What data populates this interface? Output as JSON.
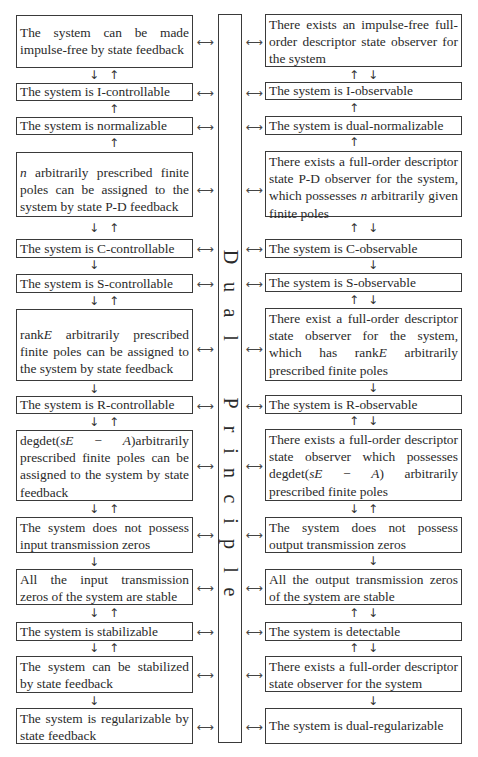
{
  "center": {
    "label": "Dual Principle",
    "letters": [
      "D",
      "u",
      "a",
      "l",
      "P",
      "r",
      "i",
      "n",
      "c",
      "i",
      "p",
      "l",
      "e"
    ]
  },
  "left": [
    {
      "text": "The system can be made impulse-free by state feedback"
    },
    {
      "text": "The system is I-controllable"
    },
    {
      "text": "The system is normalizable"
    },
    {
      "text": "n arbitrarily prescribed finite poles can be assigned to the system by state P-D feedback"
    },
    {
      "text": "The system is C-controllable"
    },
    {
      "text": "The system is S-controllable"
    },
    {
      "text": "rankE arbitrarily prescribed finite poles can be assigned to the system by state feedback"
    },
    {
      "text": "The system is R-controllable"
    },
    {
      "text": "degdet(sE − A)arbitrarily prescribed finite poles can be assigned to the system by state feedback"
    },
    {
      "text": "The system does not possess input transmission zeros"
    },
    {
      "text": "All the input transmission zeros of the system are stable"
    },
    {
      "text": "The system is stabilizable"
    },
    {
      "text": "The system can be stabilized by state feedback"
    },
    {
      "text": "The system is regularizable by state feedback"
    }
  ],
  "right": [
    {
      "text": "There exists an impulse-free full-order descriptor state observer for the system"
    },
    {
      "text": "The system is I-observable"
    },
    {
      "text": "The system is dual-normalizable"
    },
    {
      "text": "There exists a full-order descriptor state P-D observer for the system, which possesses n arbitrarily given finite poles"
    },
    {
      "text": "The system is C-observable"
    },
    {
      "text": "The system is S-observable"
    },
    {
      "text": "There exist a full-order descriptor state observer for the system, which has rankE arbitrarily prescribed finite poles"
    },
    {
      "text": "The system is R-observable"
    },
    {
      "text": "There exists a full-order descriptor state observer which possesses degdet(sE − A) arbitrarily prescribed finite poles"
    },
    {
      "text": "The system does not possess output transmission zeros"
    },
    {
      "text": "All the output transmission zeros of the system are stable"
    },
    {
      "text": "The system is detectable"
    },
    {
      "text": "There exists a full-order descriptor state observer for the system"
    },
    {
      "text": "The system is dual-regularizable"
    }
  ],
  "segments": {
    "l1": "The system can be made impulse-free by state feedback",
    "l2": "The system is I-controllable",
    "l3": "The system is normalizable",
    "l4_var": "n",
    "l4_rest": " arbitrarily prescribed finite poles can be assigned to the system by state P-D feedback",
    "l5": "The system is C-controllable",
    "l6": "The system is S-controllable",
    "l7_pre": "rank",
    "l7_var": "E",
    "l7_rest": " arbitrarily prescribed finite poles can be assigned to the system by state feedback",
    "l8": "The system is R-controllable",
    "l9_pre": "degdet(",
    "l9_var1": "sE",
    "l9_minus": " − ",
    "l9_var2": "A",
    "l9_rest": ")arbitrarily prescribed finite poles can be assigned to the system by state feedback",
    "l10": "The system does not possess input transmission zeros",
    "l11": "All the input transmission zeros of the system are stable",
    "l12": "The system is stabilizable",
    "l13": "The system can be stabilized by state feedback",
    "l14": "The system is regularizable by state feedback",
    "r1": "There exists an impulse-free full-order descriptor state observer for the system",
    "r2": "The system is I-observable",
    "r3": "The system is dual-normalizable",
    "r4_pre": "There exists a full-order descriptor state P-D observer for the system, which possesses ",
    "r4_var": "n",
    "r4_rest": " arbitrarily given finite poles",
    "r5": "The system is C-observable",
    "r6": "The system is S-observable",
    "r7_pre": "There exist a full-order descriptor state observer for the system, which has rank",
    "r7_var": "E",
    "r7_rest": " arbitrarily prescribed finite poles",
    "r8": "The system is R-observable",
    "r9_pre": "There exists a full-order descriptor state observer which possesses degdet(",
    "r9_var1": "sE",
    "r9_minus": " − ",
    "r9_var2": "A",
    "r9_rest": ") arbitrarily prescribed finite poles",
    "r10": "The system does not possess output transmission zeros",
    "r11": "All the output transmission zeros of the system are stable",
    "r12": "The system is detectable",
    "r13": "There exists a full-order descriptor state observer for the system",
    "r14": "The system is dual-regularizable"
  },
  "arrows": {
    "down": "↓",
    "up": "↑",
    "both": "⟷"
  }
}
